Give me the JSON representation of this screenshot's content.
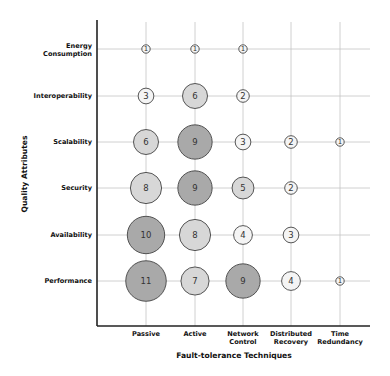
{
  "chart_data": {
    "type": "bubble",
    "title": "",
    "xlabel": "Fault-tolerance Techniques",
    "ylabel": "Quality Attributes",
    "categories_x": [
      "Passive",
      "Active",
      "Network Control",
      "Distributed Recovery",
      "Time Redundancy"
    ],
    "categories_y": [
      "Energy Consumption",
      "Interoperability",
      "Scalability",
      "Security",
      "Availability",
      "Performance"
    ],
    "grid": true,
    "legend": null,
    "points": [
      {
        "x": "Passive",
        "y": "Energy Consumption",
        "value": 1
      },
      {
        "x": "Active",
        "y": "Energy Consumption",
        "value": 1
      },
      {
        "x": "Network Control",
        "y": "Energy Consumption",
        "value": 1
      },
      {
        "x": "Passive",
        "y": "Interoperability",
        "value": 3
      },
      {
        "x": "Active",
        "y": "Interoperability",
        "value": 6
      },
      {
        "x": "Network Control",
        "y": "Interoperability",
        "value": 2
      },
      {
        "x": "Passive",
        "y": "Scalability",
        "value": 6
      },
      {
        "x": "Active",
        "y": "Scalability",
        "value": 9
      },
      {
        "x": "Network Control",
        "y": "Scalability",
        "value": 3
      },
      {
        "x": "Distributed Recovery",
        "y": "Scalability",
        "value": 2
      },
      {
        "x": "Time Redundancy",
        "y": "Scalability",
        "value": 1
      },
      {
        "x": "Passive",
        "y": "Security",
        "value": 8
      },
      {
        "x": "Active",
        "y": "Security",
        "value": 9
      },
      {
        "x": "Network Control",
        "y": "Security",
        "value": 5
      },
      {
        "x": "Distributed Recovery",
        "y": "Security",
        "value": 2
      },
      {
        "x": "Passive",
        "y": "Availability",
        "value": 10
      },
      {
        "x": "Active",
        "y": "Availability",
        "value": 8
      },
      {
        "x": "Network Control",
        "y": "Availability",
        "value": 4
      },
      {
        "x": "Distributed Recovery",
        "y": "Availability",
        "value": 3
      },
      {
        "x": "Passive",
        "y": "Performance",
        "value": 11
      },
      {
        "x": "Active",
        "y": "Performance",
        "value": 7
      },
      {
        "x": "Network Control",
        "y": "Performance",
        "value": 9
      },
      {
        "x": "Distributed Recovery",
        "y": "Performance",
        "value": 4
      },
      {
        "x": "Time Redundancy",
        "y": "Performance",
        "value": 1
      }
    ]
  },
  "labels": {
    "x_ticks": [
      {
        "line1": "Passive",
        "line2": ""
      },
      {
        "line1": "Active",
        "line2": ""
      },
      {
        "line1": "Network",
        "line2": "Control"
      },
      {
        "line1": "Distributed",
        "line2": "Recovery"
      },
      {
        "line1": "Time",
        "line2": "Redundancy"
      }
    ],
    "y_ticks": [
      {
        "line1": "Energy",
        "line2": "Consumption"
      },
      {
        "line1": "Interoperability",
        "line2": ""
      },
      {
        "line1": "Scalability",
        "line2": ""
      },
      {
        "line1": "Security",
        "line2": ""
      },
      {
        "line1": "Availability",
        "line2": ""
      },
      {
        "line1": "Performance",
        "line2": ""
      }
    ],
    "x_axis_title": "Fault-tolerance Techniques",
    "y_axis_title": "Quality Attributes"
  },
  "colors": {
    "bubble_high": "#a9a9a9",
    "bubble_mid": "#d7d7d7",
    "bubble_low": "#f4f4f4",
    "bubble_stroke": "#444444",
    "grid": "#c4c4c4",
    "axis": "#222222"
  }
}
